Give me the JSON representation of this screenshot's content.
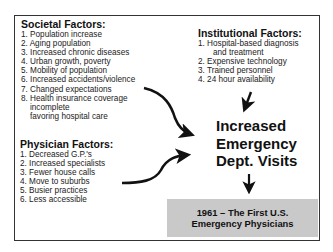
{
  "societal": {
    "title": "Societal Factors:",
    "items": [
      "1. Population increase",
      "2. Aging population",
      "3. Increased chronic diseases",
      "4. Urban growth, poverty",
      "5. Mobility of population",
      "6. Increased accidents/violence",
      "7. Changed expectations",
      "8. Health insurance coverage"
    ],
    "subitems": [
      "incomplete",
      "favoring hospital care"
    ]
  },
  "institutional": {
    "title": "Institutional Factors:",
    "items": [
      "1. Hospital-based diagnosis",
      "2. Expensive technology",
      "3. Trained personnel",
      "4. 24 hour availability"
    ],
    "item1_continuation": "and treatment"
  },
  "physician": {
    "title": "Physician Factors:",
    "items": [
      "1. Decreased G.P.'s",
      "2. Increased specialists",
      "3. Fewer house calls",
      "4. Move to suburbs",
      "5. Busier practices",
      "6. Less accessible"
    ]
  },
  "center": {
    "lines": [
      "Increased",
      "Emergency",
      "Dept. Visits"
    ]
  },
  "result": {
    "lines": [
      "1961 – The First U.S.",
      "Emergency Physicians"
    ],
    "background": "#c9c9c9"
  },
  "arrows": [
    {
      "name": "arrow-societal-to-visits",
      "from": "Societal Factors",
      "to": "Increased Emergency Dept. Visits"
    },
    {
      "name": "arrow-physician-to-visits",
      "from": "Physician Factors",
      "to": "Increased Emergency Dept. Visits"
    },
    {
      "name": "arrow-institutional-to-visits",
      "from": "Institutional Factors",
      "to": "Increased Emergency Dept. Visits"
    },
    {
      "name": "arrow-visits-to-result",
      "from": "Increased Emergency Dept. Visits",
      "to": "1961 – The First U.S. Emergency Physicians"
    }
  ]
}
